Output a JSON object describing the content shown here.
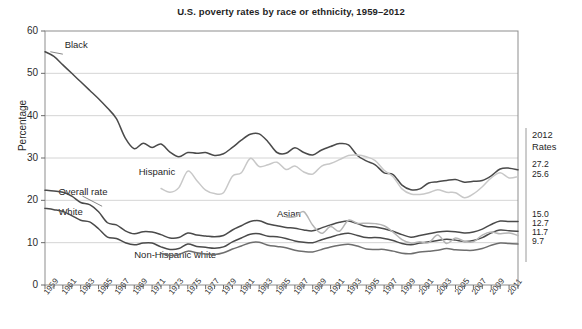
{
  "chart_data": {
    "type": "line",
    "title": "U.S. poverty rates by race or ethnicity, 1959–2012",
    "xlabel": "",
    "ylabel": "Percentage",
    "ylim": [
      0,
      60
    ],
    "ytick_values": [
      0,
      10,
      20,
      30,
      40,
      50,
      60
    ],
    "xlim": [
      1959,
      2012
    ],
    "xtick_labels": [
      "1959",
      "1961",
      "1963",
      "1965",
      "1967",
      "1969",
      "1971",
      "1973",
      "1975",
      "1977",
      "1979",
      "1981",
      "1983",
      "1985",
      "1987",
      "1989",
      "1991",
      "1993",
      "1995",
      "1997",
      "1999",
      "2001",
      "2003",
      "2005",
      "2007",
      "2009",
      "2011"
    ],
    "grid": "horizontal",
    "legend_position": "inline-annotations",
    "x": [
      1959,
      1960,
      1961,
      1962,
      1963,
      1964,
      1965,
      1966,
      1967,
      1968,
      1969,
      1970,
      1971,
      1972,
      1973,
      1974,
      1975,
      1976,
      1977,
      1978,
      1979,
      1980,
      1981,
      1982,
      1983,
      1984,
      1985,
      1986,
      1987,
      1988,
      1989,
      1990,
      1991,
      1992,
      1993,
      1994,
      1995,
      1996,
      1997,
      1998,
      1999,
      2000,
      2001,
      2002,
      2003,
      2004,
      2005,
      2006,
      2007,
      2008,
      2009,
      2010,
      2011,
      2012
    ],
    "series": [
      {
        "name": "Black",
        "color": "#4a4a4a",
        "label_x": 1961.2,
        "label_y": 56.5,
        "values": [
          55.1,
          54.0,
          52.0,
          50.0,
          48.0,
          46.0,
          44.0,
          41.8,
          39.3,
          34.7,
          32.2,
          33.5,
          32.5,
          33.3,
          31.4,
          30.3,
          31.3,
          31.1,
          31.3,
          30.6,
          31.0,
          32.5,
          34.2,
          35.6,
          35.7,
          33.8,
          31.3,
          31.1,
          32.4,
          31.3,
          30.7,
          31.9,
          32.7,
          33.4,
          33.1,
          30.6,
          29.3,
          28.4,
          26.5,
          26.1,
          23.6,
          22.5,
          22.7,
          24.1,
          24.4,
          24.7,
          24.9,
          24.3,
          24.5,
          24.7,
          25.8,
          27.4,
          27.6,
          27.2
        ]
      },
      {
        "name": "Hispanic",
        "color": "#c8c8c8",
        "label_x": 1969.5,
        "label_y": 26.4,
        "values": [
          null,
          null,
          null,
          null,
          null,
          null,
          null,
          null,
          null,
          null,
          null,
          null,
          null,
          22.8,
          21.9,
          23.0,
          26.9,
          24.7,
          22.4,
          21.6,
          21.8,
          25.7,
          26.5,
          29.9,
          28.0,
          28.4,
          29.0,
          27.3,
          28.1,
          26.7,
          26.2,
          28.1,
          28.7,
          29.6,
          30.6,
          30.7,
          30.3,
          29.4,
          27.1,
          25.6,
          22.7,
          21.5,
          21.4,
          21.8,
          22.5,
          21.9,
          21.8,
          20.6,
          21.5,
          23.2,
          25.3,
          26.5,
          25.3,
          25.6
        ]
      },
      {
        "name": "Overall rate",
        "color": "#4a4a4a",
        "label_x": 1960.5,
        "label_y": 21.8,
        "values": [
          22.4,
          22.2,
          21.9,
          21.0,
          19.5,
          19.0,
          17.3,
          14.7,
          14.2,
          12.8,
          12.1,
          12.6,
          12.5,
          11.9,
          11.1,
          11.2,
          12.3,
          11.8,
          11.6,
          11.4,
          11.7,
          13.0,
          14.0,
          15.0,
          15.2,
          14.4,
          14.0,
          13.6,
          13.4,
          13.0,
          12.8,
          13.5,
          14.2,
          14.8,
          15.1,
          14.5,
          13.8,
          13.7,
          13.3,
          12.7,
          11.9,
          11.3,
          11.7,
          12.1,
          12.5,
          12.7,
          12.6,
          12.3,
          12.5,
          13.2,
          14.3,
          15.1,
          15.0,
          15.0
        ]
      },
      {
        "name": "White",
        "color": "#4a4a4a",
        "label_x": 1960.5,
        "label_y": 17.1,
        "values": [
          18.1,
          17.8,
          17.4,
          16.4,
          15.3,
          14.9,
          13.3,
          11.3,
          11.0,
          10.0,
          9.5,
          9.9,
          9.9,
          9.0,
          8.4,
          8.6,
          9.7,
          9.1,
          8.9,
          8.7,
          9.0,
          10.2,
          11.1,
          12.0,
          12.1,
          11.5,
          11.4,
          11.0,
          10.4,
          10.1,
          10.0,
          10.7,
          11.3,
          11.9,
          12.2,
          11.7,
          11.2,
          11.2,
          11.0,
          10.5,
          9.8,
          9.5,
          9.9,
          10.2,
          10.5,
          10.8,
          10.6,
          10.3,
          10.5,
          11.2,
          12.3,
          13.0,
          12.8,
          12.7
        ]
      },
      {
        "name": "Asian",
        "color": "#b5b5b5",
        "label_x": 1985.0,
        "label_y": 16.6,
        "values": [
          null,
          null,
          null,
          null,
          null,
          null,
          null,
          null,
          null,
          null,
          null,
          null,
          null,
          null,
          null,
          null,
          null,
          null,
          null,
          null,
          null,
          null,
          null,
          null,
          null,
          null,
          null,
          16.1,
          16.1,
          17.3,
          14.1,
          12.2,
          13.8,
          12.7,
          15.3,
          14.6,
          14.6,
          14.5,
          14.0,
          12.5,
          10.7,
          9.9,
          10.2,
          10.0,
          11.8,
          9.8,
          11.1,
          10.3,
          10.2,
          11.8,
          12.5,
          12.1,
          12.3,
          11.7
        ]
      },
      {
        "name": "Non-Hispanic white",
        "color": "#6e6e6e",
        "label_x": 1969.0,
        "label_y": 6.9,
        "values": [
          null,
          null,
          null,
          null,
          null,
          null,
          null,
          null,
          null,
          null,
          null,
          null,
          null,
          7.5,
          7.0,
          7.2,
          8.0,
          7.6,
          7.3,
          7.2,
          7.6,
          8.5,
          9.2,
          10.0,
          10.1,
          9.4,
          9.1,
          8.8,
          8.2,
          7.9,
          7.8,
          8.4,
          9.0,
          9.4,
          9.6,
          9.2,
          8.5,
          8.4,
          8.4,
          8.0,
          7.5,
          7.4,
          7.8,
          8.0,
          8.2,
          8.6,
          8.3,
          8.2,
          8.2,
          8.6,
          9.4,
          9.9,
          9.8,
          9.7
        ]
      }
    ],
    "right_panel": {
      "heading_line1": "2012",
      "heading_line2": "Rates",
      "entries": [
        {
          "label": "Black",
          "value": "27.2"
        },
        {
          "label": "Hispanic",
          "value": "25.6"
        },
        {
          "label": "Overall rate",
          "value": "15.0"
        },
        {
          "label": "White",
          "value": "12.7"
        },
        {
          "label": "Asian",
          "value": "11.7"
        },
        {
          "label": "Non-Hispanic white",
          "value": "9.7"
        }
      ]
    }
  }
}
